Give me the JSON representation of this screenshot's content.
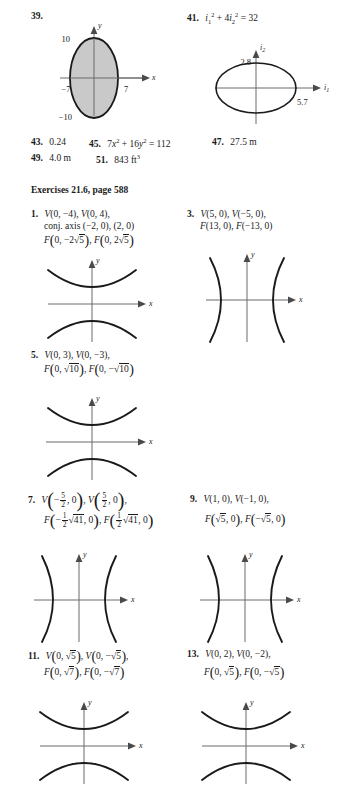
{
  "page": {
    "background": "#ffffff",
    "ink": "#1a1a1a",
    "axis_color": "#6b6b6b",
    "shade_color": "#c9c9c9"
  },
  "answers_top": {
    "p39": {
      "number": "39.",
      "graph_caption": ""
    },
    "p41": {
      "number": "41.",
      "equation_prefix": "i",
      "equation": "i₁² + 4i₂² = 32"
    },
    "p43": {
      "number": "43.",
      "answer": "0.24"
    },
    "p45": {
      "number": "45.",
      "answer": "7x² + 16y² = 112"
    },
    "p47": {
      "number": "47.",
      "answer": "27.5 m"
    },
    "p49": {
      "number": "49.",
      "answer": "4.0 m"
    },
    "p51": {
      "number": "51.",
      "answer": "843 ft³"
    }
  },
  "section_heading": "Exercises 21.6, page 588",
  "exercises": {
    "p1": {
      "number": "1.",
      "line1": "V(0, −4), V(0, 4),",
      "line2": "conj. axis (−2, 0), (2, 0)",
      "line3_a": "F(0, −2√5), F(0, 2√5)"
    },
    "p3": {
      "number": "3.",
      "line1": "V(5, 0), V(−5, 0),",
      "line2": "F(13, 0), F(−13, 0)"
    },
    "p5": {
      "number": "5.",
      "line1": "V(0, 3), V(0, −3),",
      "line2": "F(0, √10), F(0, −√10)"
    },
    "p7": {
      "number": "7.",
      "line1": "V(− 5/2, 0), V(5/2, 0),",
      "line2": "F(− 1/2 √41, 0), F(1/2 √41, 0)",
      "frac_num": "5",
      "frac_den": "2",
      "frac2_num": "1",
      "frac2_den": "2",
      "radicand": "41"
    },
    "p9": {
      "number": "9.",
      "line1": "V(1, 0), V(−1, 0),",
      "line2": "F(√5, 0), F(−√5, 0)"
    },
    "p11": {
      "number": "11.",
      "line1": "V(0, √5), V(0, −√5),",
      "line2": "F(0, √7), F(0, −√7)"
    },
    "p13": {
      "number": "13.",
      "number_label": "13.",
      "line1": "V(0, 2), V(0, −2),",
      "line2": "F(0, √5), F(0, −√5)"
    }
  },
  "graphs": {
    "g39": {
      "type": "ellipse",
      "orientation": "vertical",
      "shaded": true,
      "axis_x_label": "x",
      "axis_y_label": "y",
      "tick_top": "10",
      "tick_bottom": "−10",
      "tick_left": "−7",
      "tick_right": "7",
      "semi_major_y": 10,
      "semi_minor_x": 7
    },
    "g41": {
      "type": "ellipse",
      "orientation": "horizontal",
      "shaded": false,
      "axis_x_label": "i₁",
      "axis_y_label": "i₂",
      "tick_top": "2.8",
      "tick_right": "5.7",
      "semi_major_x": 5.7,
      "semi_minor_y": 2.8
    },
    "g1": {
      "type": "hyperbola",
      "opens": "vertical",
      "axis_x_label": "x",
      "axis_y_label": "y"
    },
    "g3": {
      "type": "hyperbola",
      "opens": "horizontal",
      "axis_x_label": "x",
      "axis_y_label": "y"
    },
    "g5": {
      "type": "hyperbola",
      "opens": "vertical",
      "axis_x_label": "x",
      "axis_y_label": "y"
    },
    "g7": {
      "type": "hyperbola",
      "opens": "horizontal",
      "axis_x_label": "x",
      "axis_y_label": "y"
    },
    "g9": {
      "type": "hyperbola",
      "opens": "horizontal",
      "axis_x_label": "x",
      "axis_y_label": "y"
    },
    "g11": {
      "type": "hyperbola",
      "opens": "vertical",
      "axis_x_label": "x",
      "axis_y_label": "y"
    },
    "g13": {
      "type": "hyperbola",
      "opens": "vertical",
      "axis_x_label": "x",
      "axis_y_label": "y"
    }
  }
}
